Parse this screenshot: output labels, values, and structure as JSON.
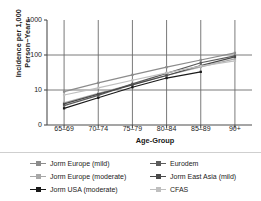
{
  "chart_data": {
    "type": "line",
    "title": "",
    "subtitle": "",
    "xlabel": "Age-Group",
    "ylabel": "Incidence per 1,000 Person−Years",
    "ylabel_line1": "Incidence per 1,000",
    "ylabel_line2": "Person−Years",
    "categories": [
      "65–69",
      "70–74",
      "75–79",
      "80–84",
      "85–89",
      "90+"
    ],
    "yscale": "log",
    "ylim": [
      1,
      1000
    ],
    "ytick_labels": [
      "1000",
      "100",
      "10",
      "0"
    ],
    "ytick_values": [
      1000,
      100,
      10,
      1
    ],
    "grid": true,
    "grid_axis": "both",
    "legend_position": "bottom",
    "legend_columns": 2,
    "series": [
      {
        "name": "Jorm Europe (mild)",
        "color": "#8c8c8c",
        "marker": "square",
        "values": [
          9.0,
          16.0,
          27.0,
          45.0,
          72.0,
          115.0
        ]
      },
      {
        "name": "Jorm Europe (moderate)",
        "color": "#a8a8a8",
        "marker": "square",
        "values": [
          4.3,
          8.0,
          14.5,
          26.0,
          46.0,
          78.0
        ]
      },
      {
        "name": "Jorm USA (moderate)",
        "color": "#1a1a1a",
        "marker": "square",
        "values": [
          3.0,
          6.0,
          12.0,
          22.0,
          33.0,
          null
        ]
      },
      {
        "name": "Eurodem",
        "color": "#5c5c5c",
        "marker": "square",
        "values": [
          3.6,
          7.0,
          15.0,
          30.0,
          60.0,
          94.0
        ]
      },
      {
        "name": "Jorm East Asia (mild)",
        "color": "#4a4a4a",
        "marker": "square",
        "values": [
          4.0,
          7.6,
          14.0,
          26.0,
          50.0,
          88.0
        ]
      },
      {
        "name": "CFAS",
        "color": "#bfbfbf",
        "marker": "square",
        "values": [
          7.2,
          11.5,
          19.0,
          31.0,
          48.0,
          68.0
        ]
      }
    ]
  },
  "legend": {
    "items": [
      {
        "label": "Jorm Europe (mild)",
        "color": "#8c8c8c"
      },
      {
        "label": "Jorm Europe (moderate)",
        "color": "#a8a8a8"
      },
      {
        "label": "Jorm USA (moderate)",
        "color": "#1a1a1a"
      },
      {
        "label": "Eurodem",
        "color": "#5c5c5c"
      },
      {
        "label": "Jorm East Asia (mild)",
        "color": "#4a4a4a"
      },
      {
        "label": "CFAS",
        "color": "#bfbfbf"
      }
    ]
  },
  "colors": {
    "axis": "#4d4d4d",
    "grid": "#6b6b6b",
    "text": "#1a1a1a",
    "background": "#ffffff"
  }
}
